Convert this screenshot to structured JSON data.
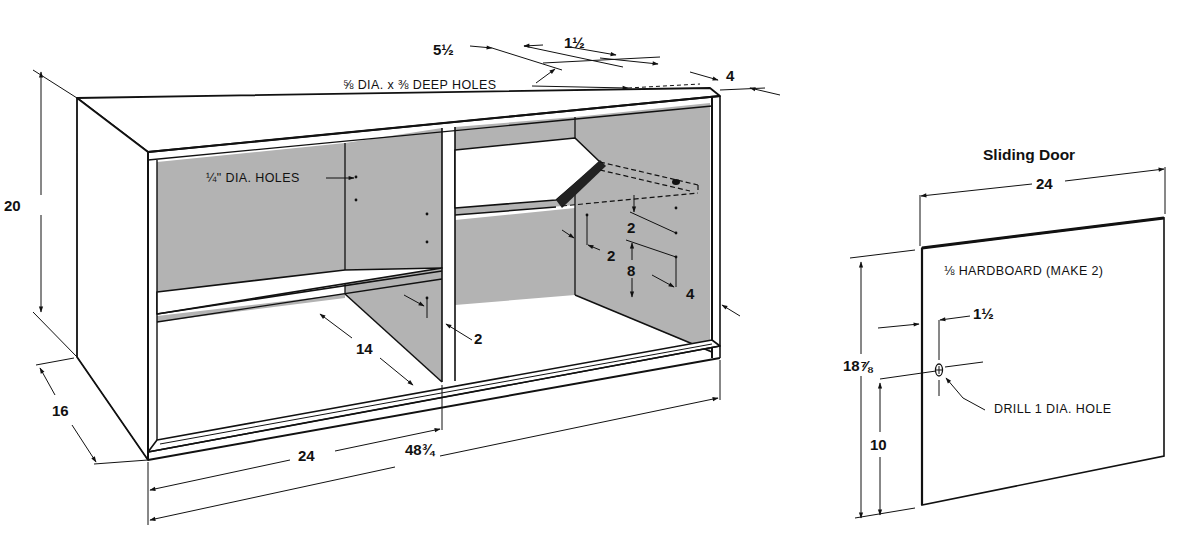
{
  "drawing": {
    "colors": {
      "line": "#111111",
      "panel_gray": "#b3b3b3",
      "background": "#ffffff"
    },
    "cabinet": {
      "name": "Open cabinet with shelves (isometric)",
      "dimensions": {
        "height": "20",
        "depth": "16",
        "overall_width": "48¾",
        "half_width": "24",
        "shelf_depth": "14",
        "top_hole_offset_a": "5½",
        "top_hole_offset_b": "1½",
        "top_hole_edge": "4",
        "shelf_hole_from_top": "2",
        "shelf_hole_spacing": "8",
        "shelf_hole_inset_front": "2",
        "shelf_hole_inset_back": "4",
        "divider_inset": "2",
        "side_hole_inset": "2"
      },
      "notes": {
        "top_holes": "⅝ DIA. x ⅜ DEEP HOLES",
        "shelf_holes": "¼\" DIA. HOLES"
      }
    },
    "sliding_door": {
      "title": "Sliding Door",
      "dimensions": {
        "width": "24",
        "height": "18⅞",
        "hole_height": "10",
        "hole_inset": "1½"
      },
      "notes": {
        "material": "⅛ HARDBOARD (MAKE 2)",
        "drill": "DRILL 1 DIA. HOLE"
      }
    }
  }
}
